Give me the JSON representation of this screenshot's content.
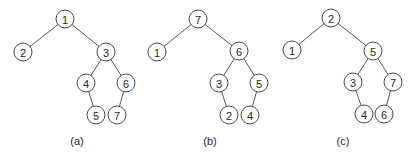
{
  "figure": {
    "trees": [
      {
        "caption": "(a)",
        "caption_pos": [
          77,
          141
        ],
        "nodes": [
          {
            "id": "1",
            "x": 65,
            "y": 19
          },
          {
            "id": "2",
            "x": 23,
            "y": 52
          },
          {
            "id": "3",
            "x": 106,
            "y": 52
          },
          {
            "id": "4",
            "x": 86,
            "y": 83
          },
          {
            "id": "6",
            "x": 126,
            "y": 83
          },
          {
            "id": "5",
            "x": 96,
            "y": 115
          },
          {
            "id": "7",
            "x": 117,
            "y": 115
          }
        ],
        "edges": [
          [
            "1",
            "2"
          ],
          [
            "1",
            "3"
          ],
          [
            "3",
            "4"
          ],
          [
            "3",
            "6"
          ],
          [
            "4",
            "5"
          ],
          [
            "6",
            "7"
          ]
        ]
      },
      {
        "caption": "(b)",
        "caption_pos": [
          210,
          141
        ],
        "nodes": [
          {
            "id": "7",
            "x": 198,
            "y": 19
          },
          {
            "id": "1",
            "x": 157,
            "y": 52
          },
          {
            "id": "6",
            "x": 239,
            "y": 51
          },
          {
            "id": "3",
            "x": 219,
            "y": 83
          },
          {
            "id": "5",
            "x": 259,
            "y": 83
          },
          {
            "id": "2",
            "x": 229,
            "y": 115
          },
          {
            "id": "4",
            "x": 250,
            "y": 115
          }
        ],
        "edges": [
          [
            "7",
            "1"
          ],
          [
            "7",
            "6"
          ],
          [
            "6",
            "3"
          ],
          [
            "6",
            "5"
          ],
          [
            "3",
            "2"
          ],
          [
            "5",
            "4"
          ]
        ]
      },
      {
        "caption": "(c)",
        "caption_pos": [
          343,
          141
        ],
        "nodes": [
          {
            "id": "2",
            "x": 331,
            "y": 18
          },
          {
            "id": "1",
            "x": 292,
            "y": 50
          },
          {
            "id": "5",
            "x": 373,
            "y": 51
          },
          {
            "id": "3",
            "x": 353,
            "y": 82
          },
          {
            "id": "7",
            "x": 393,
            "y": 82
          },
          {
            "id": "4",
            "x": 364,
            "y": 114
          },
          {
            "id": "6",
            "x": 384,
            "y": 114
          }
        ],
        "edges": [
          [
            "2",
            "1"
          ],
          [
            "2",
            "5"
          ],
          [
            "5",
            "3"
          ],
          [
            "5",
            "7"
          ],
          [
            "3",
            "4"
          ],
          [
            "7",
            "6"
          ]
        ]
      }
    ],
    "node_radius": 9,
    "colors": {
      "edge": "#5a5a5a",
      "node_stroke": "#4a4a4a",
      "text": "#2a2a2a",
      "background": "#ffffff"
    }
  }
}
